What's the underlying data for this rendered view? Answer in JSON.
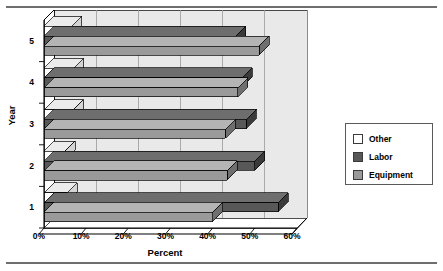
{
  "chart_data": {
    "type": "bar",
    "orientation": "horizontal",
    "title": "",
    "xlabel": "Percent",
    "ylabel": "Year",
    "categories": [
      "1",
      "2",
      "3",
      "4",
      "5"
    ],
    "xlim": [
      0,
      60
    ],
    "xtick_labels": [
      "0%",
      "10%",
      "20%",
      "30%",
      "40%",
      "50%",
      "60%"
    ],
    "xtick_values": [
      0,
      10,
      20,
      30,
      40,
      50,
      60
    ],
    "grid": true,
    "legend_position": "right",
    "series": [
      {
        "name": "Other",
        "color": "#ffffff",
        "side_color": "#d4d4d4",
        "top_color": "#ebebeb",
        "values": [
          5.5,
          5.0,
          7.0,
          7.0,
          6.5
        ]
      },
      {
        "name": "Labor",
        "color": "#585858",
        "side_color": "#3a3a3a",
        "top_color": "#6e6e6e",
        "values": [
          55.5,
          50.0,
          48.0,
          47.0,
          45.5
        ]
      },
      {
        "name": "Equipment",
        "color": "#9a9a9a",
        "side_color": "#6f6f6f",
        "top_color": "#b4b4b4",
        "values": [
          40.0,
          43.5,
          43.0,
          46.0,
          51.0
        ]
      }
    ]
  },
  "legend": {
    "items": [
      {
        "label": "Other"
      },
      {
        "label": "Labor"
      },
      {
        "label": "Equipment"
      }
    ]
  },
  "colors": {
    "plot_background": "#e9e9e9",
    "frame": "#000000",
    "gridline": "#9a9a9a",
    "rule": "#6e6e6e"
  }
}
